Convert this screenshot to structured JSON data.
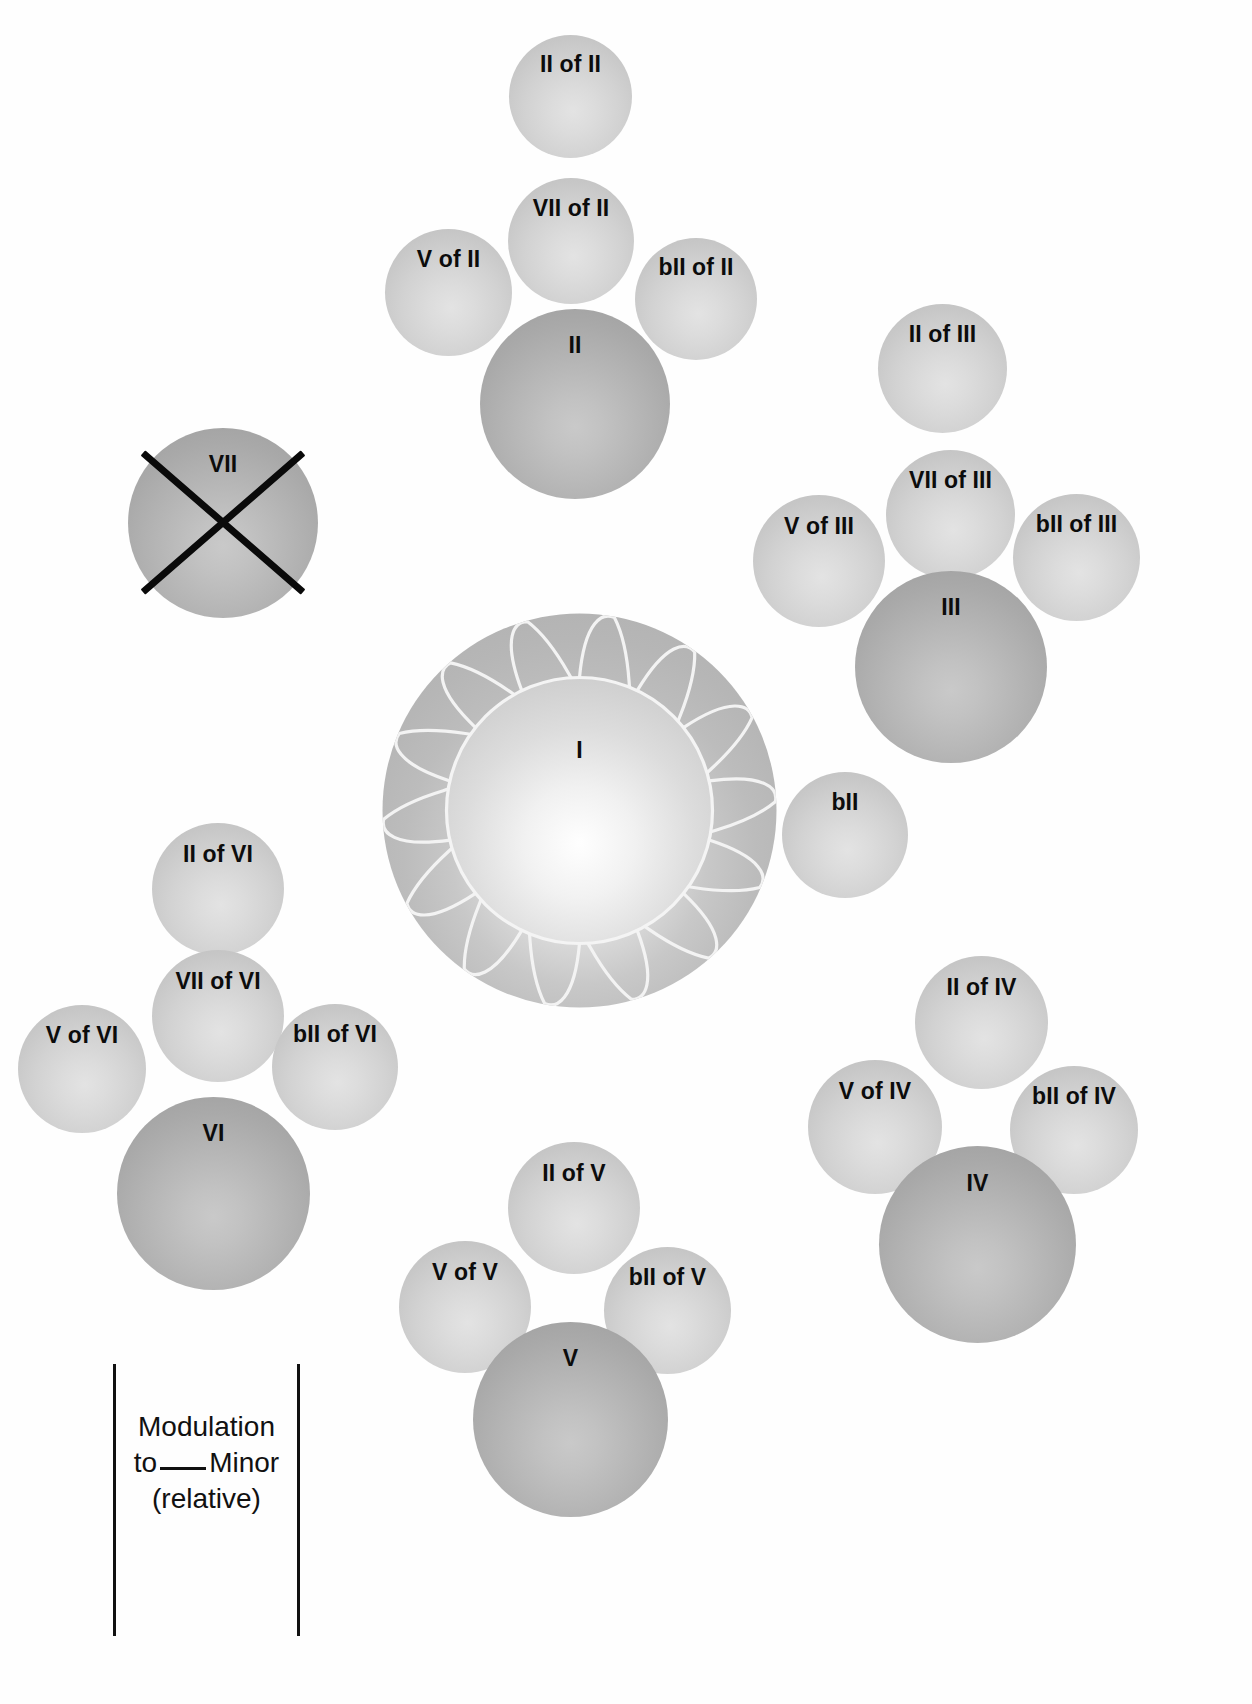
{
  "diagram": {
    "background_color": "#ffffff",
    "primary_sphere_color": "#b2b2b2",
    "secondary_sphere_color": "#d3d3d3",
    "text_color": "#0c0c0c",
    "cross_color": "#0a0a0a"
  },
  "center": {
    "label": "I",
    "kind": "sun",
    "ray_count": 14
  },
  "crossed_out": {
    "label": "VII",
    "kind": "primary",
    "struck_through": true
  },
  "clusters": [
    {
      "id": "ii",
      "root": {
        "label": "II",
        "kind": "primary"
      },
      "satellites": [
        {
          "label": "II of II",
          "kind": "secondary",
          "position": "top"
        },
        {
          "label": "VII of II",
          "kind": "secondary",
          "position": "upper"
        },
        {
          "label": "V of II",
          "kind": "secondary",
          "position": "left"
        },
        {
          "label": "bII of II",
          "kind": "secondary",
          "position": "right"
        }
      ]
    },
    {
      "id": "iii",
      "root": {
        "label": "III",
        "kind": "primary"
      },
      "satellites": [
        {
          "label": "II of III",
          "kind": "secondary",
          "position": "top"
        },
        {
          "label": "VII of III",
          "kind": "secondary",
          "position": "upper"
        },
        {
          "label": "V of III",
          "kind": "secondary",
          "position": "left"
        },
        {
          "label": "bII of III",
          "kind": "secondary",
          "position": "right"
        }
      ]
    },
    {
      "id": "iv",
      "root": {
        "label": "IV",
        "kind": "primary"
      },
      "satellites": [
        {
          "label": "II of IV",
          "kind": "secondary",
          "position": "top"
        },
        {
          "label": "V of IV",
          "kind": "secondary",
          "position": "left"
        },
        {
          "label": "bII of IV",
          "kind": "secondary",
          "position": "right"
        }
      ]
    },
    {
      "id": "v",
      "root": {
        "label": "V",
        "kind": "primary"
      },
      "satellites": [
        {
          "label": "II of V",
          "kind": "secondary",
          "position": "top"
        },
        {
          "label": "V of V",
          "kind": "secondary",
          "position": "left"
        },
        {
          "label": "bII of V",
          "kind": "secondary",
          "position": "right"
        }
      ]
    },
    {
      "id": "vi",
      "root": {
        "label": "VI",
        "kind": "primary"
      },
      "satellites": [
        {
          "label": "II of VI",
          "kind": "secondary",
          "position": "top"
        },
        {
          "label": "VII of VI",
          "kind": "secondary",
          "position": "upper"
        },
        {
          "label": "V of VI",
          "kind": "secondary",
          "position": "left"
        },
        {
          "label": "bII of VI",
          "kind": "secondary",
          "position": "right"
        }
      ]
    }
  ],
  "lone_satellites": [
    {
      "id": "bii",
      "label": "bII",
      "kind": "secondary"
    }
  ],
  "annotation": {
    "line1": "Modulation",
    "line2_before": "to",
    "line2_blank": "___",
    "line2_after": "Minor",
    "line3": "(relative)",
    "bracket": true
  },
  "nodes": {
    "ii_of_ii": {
      "label": "II of II"
    },
    "vii_of_ii": {
      "label": "VII of II"
    },
    "v_of_ii": {
      "label": "V of II"
    },
    "bii_of_ii": {
      "label": "bII of II"
    },
    "ii": {
      "label": "II"
    },
    "ii_of_iii": {
      "label": "II of III"
    },
    "vii_of_iii": {
      "label": "VII of III"
    },
    "v_of_iii": {
      "label": "V of III"
    },
    "bii_of_iii": {
      "label": "bII of III"
    },
    "iii": {
      "label": "III"
    },
    "bii": {
      "label": "bII"
    },
    "vii": {
      "label": "VII"
    },
    "i": {
      "label": "I"
    },
    "ii_of_vi": {
      "label": "II of VI"
    },
    "vii_of_vi": {
      "label": "VII of VI"
    },
    "v_of_vi": {
      "label": "V of VI"
    },
    "bii_of_vi": {
      "label": "bII of VI"
    },
    "vi": {
      "label": "VI"
    },
    "ii_of_v": {
      "label": "II of V"
    },
    "v_of_v": {
      "label": "V of V"
    },
    "bii_of_v": {
      "label": "bII of V"
    },
    "v": {
      "label": "V"
    },
    "ii_of_iv": {
      "label": "II of IV"
    },
    "v_of_iv": {
      "label": "V of IV"
    },
    "bii_of_iv": {
      "label": "bII of IV"
    },
    "iv": {
      "label": "IV"
    }
  }
}
